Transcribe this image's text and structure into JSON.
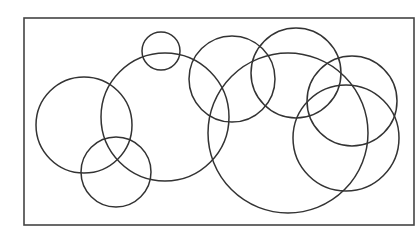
{
  "diagram": {
    "type": "overlapping-circles",
    "background": "#ffffff",
    "stroke_color": "#333333",
    "frame": {
      "x": 24,
      "y": 18,
      "width": 390,
      "height": 207,
      "stroke": "#444444",
      "stroke_width": 1.6
    },
    "circles": [
      {
        "id": "circle-left",
        "cx": 84,
        "cy": 125,
        "r": 48
      },
      {
        "id": "circle-bottom-left",
        "cx": 116,
        "cy": 172,
        "r": 35
      },
      {
        "id": "circle-small-top",
        "cx": 161,
        "cy": 51,
        "r": 19
      },
      {
        "id": "circle-center-left",
        "cx": 165,
        "cy": 117,
        "r": 64
      },
      {
        "id": "circle-top-middle",
        "cx": 232,
        "cy": 79,
        "r": 43
      },
      {
        "id": "circle-top-right",
        "cx": 296,
        "cy": 73,
        "r": 45
      },
      {
        "id": "circle-large",
        "cx": 288,
        "cy": 133,
        "r": 80
      },
      {
        "id": "circle-right-upper",
        "cx": 352,
        "cy": 101,
        "r": 45
      },
      {
        "id": "circle-right-lower",
        "cx": 346,
        "cy": 138,
        "r": 53
      }
    ],
    "circle_stroke_width": 1.5
  }
}
